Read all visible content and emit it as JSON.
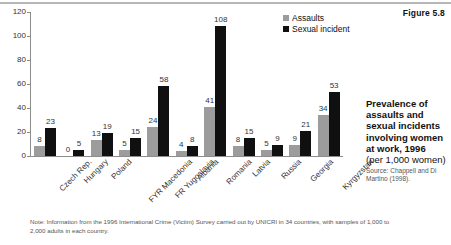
{
  "figure_number": "Figure 5.8",
  "legend": {
    "items": [
      {
        "label": "Assaults",
        "color": "#9c9c9c"
      },
      {
        "label": "Sexual incident",
        "color": "#101010"
      }
    ]
  },
  "caption": {
    "title": "Prevalence of assaults and sexual incidents involving women at work, 1996",
    "subtitle": "(per 1,000 women)",
    "source": "Source: Chappell and Di Martino (1998)."
  },
  "footnote": "Note: Information from the 1996 International Crime (Victim) Survey carried out by UNICRI in 34 countries, with samples of 1,000 to 2,000 adults in each country.",
  "chart_data": {
    "type": "bar",
    "title": "Prevalence of assaults and sexual incidents involving women at work, 1996",
    "xlabel": "",
    "ylabel": "",
    "ylim": [
      0,
      120
    ],
    "yticks": [
      0,
      20,
      40,
      60,
      80,
      100,
      120
    ],
    "grid": false,
    "legend_position": "top-right",
    "categories": [
      "Czech Rep.",
      "Hungary",
      "Poland",
      "FYR Macedonia",
      "FR Yugoslavia",
      "Albania",
      "Romania",
      "Latvia",
      "Russia",
      "Georgia",
      "Kyrgyzstan"
    ],
    "series": [
      {
        "name": "Assaults",
        "color": "#9c9c9c",
        "values": [
          8,
          0,
          13,
          5,
          24,
          4,
          41,
          8,
          5,
          9,
          34
        ]
      },
      {
        "name": "Sexual incident",
        "color": "#101010",
        "values": [
          23,
          5,
          19,
          15,
          58,
          8,
          108,
          15,
          9,
          21,
          53
        ]
      }
    ]
  }
}
